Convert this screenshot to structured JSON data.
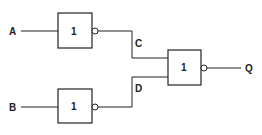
{
  "diagram": {
    "type": "logic-circuit",
    "inputs": [
      {
        "id": "A",
        "label": "A"
      },
      {
        "id": "B",
        "label": "B"
      }
    ],
    "gates": [
      {
        "id": "gate1",
        "symbol": "1",
        "type": "NOT",
        "input": "A",
        "output": "C"
      },
      {
        "id": "gate2",
        "symbol": "1",
        "type": "NOT",
        "input": "B",
        "output": "D"
      },
      {
        "id": "gate3",
        "symbol": "1",
        "type": "NOR",
        "inputs": [
          "C",
          "D"
        ],
        "output": "Q"
      }
    ],
    "wires": [
      {
        "label": "C"
      },
      {
        "label": "D"
      }
    ],
    "output": {
      "id": "Q",
      "label": "Q"
    }
  }
}
